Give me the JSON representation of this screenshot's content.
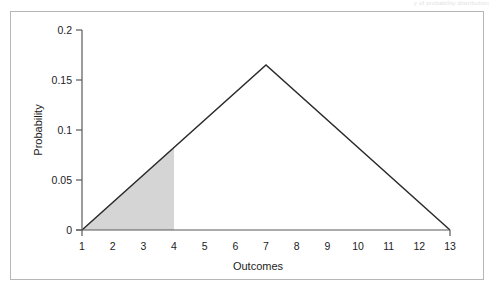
{
  "page": {
    "header_text": "y of probability distribution"
  },
  "figure": {
    "frame_color": "#b6b6b6",
    "background": "#ffffff"
  },
  "chart_data": {
    "type": "line",
    "title": "",
    "subtitle": "",
    "xlabel": "Outcomes",
    "ylabel": "Probability",
    "xlim": [
      1,
      13
    ],
    "ylim": [
      0,
      0.2
    ],
    "grid": false,
    "legend": false,
    "legend_position": "none",
    "x_ticks": [
      1,
      2,
      3,
      4,
      5,
      6,
      7,
      8,
      9,
      10,
      11,
      12,
      13
    ],
    "x_tick_labels": [
      "1",
      "2",
      "3",
      "4",
      "5",
      "6",
      "7",
      "8",
      "9",
      "10",
      "11",
      "12",
      "13"
    ],
    "y_ticks": [
      0,
      0.05,
      0.1,
      0.15,
      0.2
    ],
    "y_tick_labels": [
      "0",
      "0.05",
      "0.1",
      "0.15",
      "0.2"
    ],
    "series": [
      {
        "name": "Triangular probability distribution",
        "line_color": "#2b2b2b",
        "x": [
          1,
          7,
          13
        ],
        "values": [
          0,
          0.165,
          0
        ]
      }
    ],
    "annotations": [
      {
        "name": "shaded-region",
        "kind": "area-fill",
        "fill_color": "#d5d5d5",
        "x_from": 1,
        "x_to": 4,
        "y_at_x_from": 0,
        "y_at_x_to": 0.0825
      }
    ]
  }
}
